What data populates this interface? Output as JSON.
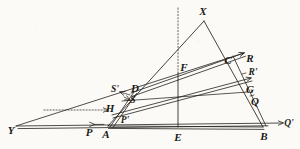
{
  "figure": {
    "kind": "geometric-construction-diagram",
    "background_color": "#fbfaf7",
    "ink_color": "#23211d",
    "width": 300,
    "height": 149,
    "points": [
      {
        "id": "Y",
        "label": "Y",
        "x": 11,
        "y": 130
      },
      {
        "id": "P",
        "label": "P",
        "x": 89,
        "y": 132
      },
      {
        "id": "A",
        "label": "A",
        "x": 106,
        "y": 133
      },
      {
        "id": "Pprime",
        "label": "P'",
        "x": 124,
        "y": 120
      },
      {
        "id": "H",
        "label": "H",
        "x": 111,
        "y": 108
      },
      {
        "id": "S",
        "label": "S",
        "x": 131,
        "y": 100
      },
      {
        "id": "Sprime",
        "label": "S'",
        "x": 115,
        "y": 90
      },
      {
        "id": "D",
        "label": "D",
        "x": 134,
        "y": 88
      },
      {
        "id": "F",
        "label": "F",
        "x": 183,
        "y": 67
      },
      {
        "id": "X",
        "label": "X",
        "x": 203,
        "y": 11
      },
      {
        "id": "C",
        "label": "C",
        "x": 228,
        "y": 60
      },
      {
        "id": "R",
        "label": "R",
        "x": 249,
        "y": 58
      },
      {
        "id": "Rprime",
        "label": "R'",
        "x": 252,
        "y": 73
      },
      {
        "id": "G",
        "label": "G",
        "x": 250,
        "y": 89
      },
      {
        "id": "Q",
        "label": "Q",
        "x": 254,
        "y": 101
      },
      {
        "id": "E",
        "label": "E",
        "x": 178,
        "y": 137
      },
      {
        "id": "B",
        "label": "B",
        "x": 264,
        "y": 136
      },
      {
        "id": "Qprime",
        "label": "Q'",
        "x": 288,
        "y": 124
      }
    ],
    "vertices": {
      "Y": {
        "x": 16,
        "y": 126
      },
      "A": {
        "x": 108,
        "y": 126
      },
      "E": {
        "x": 178,
        "y": 127
      },
      "B": {
        "x": 263,
        "y": 127
      },
      "X": {
        "x": 204,
        "y": 21
      },
      "C": {
        "x": 231,
        "y": 56
      },
      "D": {
        "x": 131,
        "y": 93
      },
      "S": {
        "x": 127,
        "y": 95
      },
      "H": {
        "x": 115,
        "y": 111
      },
      "G": {
        "x": 247,
        "y": 93
      },
      "Q": {
        "x": 256,
        "y": 106
      },
      "F": {
        "x": 178,
        "y": 73
      },
      "P": {
        "x": 96,
        "y": 125
      },
      "R_tip": {
        "x": 244,
        "y": 53
      },
      "Qp_tip": {
        "x": 283,
        "y": 123
      },
      "Rp_tip": {
        "x": 250,
        "y": 79
      },
      "apex_foot_left": {
        "x": 108,
        "y": 126
      },
      "apex_foot_right": {
        "x": 263,
        "y": 127
      }
    },
    "edges": [
      {
        "name": "ray-Y-to-Qprime-baseline",
        "from": "Y",
        "to": "Qprime",
        "style": "double-band",
        "arrow": true
      },
      {
        "name": "ray-Y-to-R-upper",
        "from": "Y",
        "to": "R",
        "style": "single",
        "arrow": true
      },
      {
        "name": "band-A-to-B",
        "from": "A",
        "to": "B",
        "style": "double-band",
        "arrow": false
      },
      {
        "name": "band-D-to-C",
        "from": "D",
        "to": "C",
        "style": "double-band",
        "arrow": true
      },
      {
        "name": "band-H-to-Q",
        "from": "H",
        "to": "Q",
        "style": "double-band",
        "arrow": true
      },
      {
        "name": "line-S-to-G",
        "from": "S",
        "to": "G",
        "style": "single",
        "arrow": false
      },
      {
        "name": "triangle-side-A-to-X",
        "from": "A",
        "to": "X",
        "style": "single",
        "arrow": false
      },
      {
        "name": "triangle-side-X-to-B",
        "from": "X",
        "to": "B",
        "style": "single",
        "arrow": false
      },
      {
        "name": "vertical-axis-F-to-E",
        "from": "F",
        "to": "E",
        "style": "single",
        "arrow": false
      },
      {
        "name": "dotted-axis-above-X",
        "from": "X",
        "to": "top",
        "style": "dotted",
        "arrow": false
      },
      {
        "name": "dotted-horizontal-to-H",
        "from": "left",
        "to": "H",
        "style": "dotted",
        "arrow": true
      }
    ],
    "arrow_markers": [
      {
        "name": "arrow-to-Qprime",
        "at": "Q'"
      },
      {
        "name": "arrow-to-R",
        "at": "R"
      },
      {
        "name": "arrow-to-Rprime",
        "at": "R'"
      },
      {
        "name": "arrow-to-P",
        "at": "P"
      },
      {
        "name": "arrow-to-Sprime",
        "at": "S'"
      },
      {
        "name": "arrow-to-H",
        "at": "H"
      },
      {
        "name": "arrow-to-S",
        "at": "S"
      }
    ]
  }
}
